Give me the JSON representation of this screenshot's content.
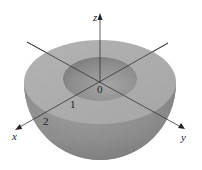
{
  "diagram": {
    "type": "hemispherical-shell",
    "axes": {
      "x_label": "x",
      "y_label": "y",
      "z_label": "z",
      "origin_label": "0"
    },
    "ticks": [
      {
        "label": "1",
        "axis": "x"
      },
      {
        "label": "2",
        "axis": "x"
      }
    ],
    "colors": {
      "top_face": "#a9a9a9",
      "outer_surface": "#8f8f8f",
      "inner_hole": "#8a8a8a",
      "axis_line": "#333333",
      "background": "#ffffff"
    }
  }
}
